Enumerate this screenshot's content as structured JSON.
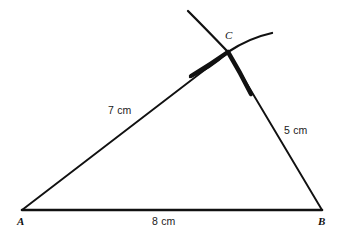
{
  "figure": {
    "type": "geometric-construction",
    "background_color": "#ffffff",
    "stroke_color": "#111111",
    "canvas": {
      "width": 341,
      "height": 240
    }
  },
  "vertices": [
    {
      "id": "A",
      "label": "A",
      "x": 22,
      "y": 210
    },
    {
      "id": "B",
      "label": "B",
      "x": 322,
      "y": 210
    },
    {
      "id": "C",
      "label": "C",
      "x": 228,
      "y": 52
    }
  ],
  "sides": [
    {
      "id": "AC",
      "label": "7 cm",
      "from": "A",
      "to": "C",
      "length_cm": 7
    },
    {
      "id": "BC",
      "label": "5 cm",
      "from": "B",
      "to": "C",
      "length_cm": 5
    },
    {
      "id": "AB",
      "label": "8 cm",
      "from": "A",
      "to": "B",
      "length_cm": 8
    }
  ],
  "arcs": [
    {
      "id": "arc-from-A",
      "center": "A",
      "radius_cm": 7,
      "note": "construction arc swung from A with radius 7 cm"
    },
    {
      "id": "arc-from-B",
      "center": "B",
      "radius_cm": 5,
      "note": "construction arc swung from B with radius 5 cm"
    }
  ]
}
